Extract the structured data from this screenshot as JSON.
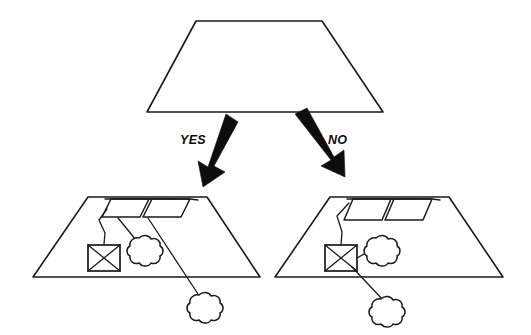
{
  "diagram": {
    "type": "decision-flow-sketch",
    "title": "",
    "background_color": "#ffffff",
    "ink_color": "#1a1a1a",
    "arrow_color": "#0d0d0d",
    "root": {
      "name": "root-trapezoid",
      "shape": "trapezoid",
      "label": "",
      "top_left_x": 196,
      "top_right_x": 322,
      "bottom_left_x": 147,
      "bottom_right_x": 383,
      "top_y": 21,
      "bottom_y": 112
    },
    "branches": [
      {
        "id": "yes",
        "label": "YES",
        "label_x": 180,
        "label_y": 143,
        "arrow_from_x": 223,
        "arrow_from_y": 114,
        "arrow_to_x": 205,
        "arrow_to_y": 186
      },
      {
        "id": "no",
        "label": "NO",
        "label_x": 328,
        "label_y": 143,
        "arrow_from_x": 296,
        "arrow_from_y": 114,
        "arrow_to_x": 340,
        "arrow_to_y": 186
      }
    ],
    "outcomes": [
      {
        "id": "yes-outcome",
        "name": "left-outcome-trapezoid",
        "shape": "trapezoid",
        "top_left_x": 88,
        "top_right_x": 207,
        "bottom_left_x": 33,
        "bottom_right_x": 260,
        "top_y": 197,
        "bottom_y": 277,
        "panels": 2,
        "box": {
          "name": "crossed-box",
          "style": "rectangle-with-x"
        },
        "clouds": 2,
        "cloud_attachment": "panels",
        "description": ""
      },
      {
        "id": "no-outcome",
        "name": "right-outcome-trapezoid",
        "shape": "trapezoid",
        "top_left_x": 330,
        "top_right_x": 449,
        "bottom_left_x": 275,
        "bottom_right_x": 503,
        "top_y": 197,
        "bottom_y": 277,
        "panels": 2,
        "box": {
          "name": "crossed-box",
          "style": "rectangle-with-x"
        },
        "clouds": 2,
        "cloud_attachment": "box",
        "description": ""
      }
    ]
  }
}
